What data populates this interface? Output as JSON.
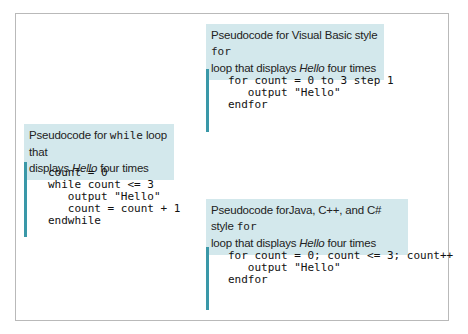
{
  "figure": {
    "panels": [
      {
        "id": "vb-for",
        "caption": {
          "prefix": "Pseudocode for Visual Basic style ",
          "keyword": "for",
          "line2_pre": "loop that displays ",
          "italic": "Hello",
          "line2_post": " four times"
        },
        "code": "for count = 0 to 3 step 1\n   output \"Hello\"\nendfor"
      },
      {
        "id": "while",
        "caption": {
          "prefix": "Pseudocode for ",
          "keyword": "while",
          "suffix": " loop that",
          "line2_pre": "displays ",
          "italic": "Hello",
          "line2_post": " four times"
        },
        "code": "count = 0\nwhile count <= 3\n   output \"Hello\"\n   count = count + 1\nendwhile"
      },
      {
        "id": "c-for",
        "caption": {
          "prefix": "Pseudocode forJava, C++, and C# style ",
          "keyword": "for",
          "line2_pre": "loop that displays ",
          "italic": "Hello",
          "line2_post": " four times"
        },
        "code": "for count = 0; count <= 3; count++\n   output \"Hello\"\nendfor"
      }
    ],
    "colors": {
      "caption_bg": "#d3e8ec",
      "accent_bar": "#3a98a8",
      "frame_border": "#b9b9b9"
    }
  }
}
